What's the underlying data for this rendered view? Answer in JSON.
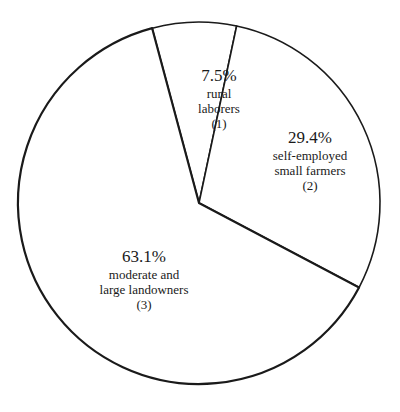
{
  "chart_data": {
    "type": "pie",
    "title": "",
    "slices": [
      {
        "label": "rural laborers",
        "number": "(1)",
        "value": 7.5,
        "pct_label": "7.5%",
        "lines": [
          "rural",
          "laborers",
          "(1)"
        ]
      },
      {
        "label": "self-employed small farmers",
        "number": "(2)",
        "value": 29.4,
        "pct_label": "29.4%",
        "lines": [
          "self-employed",
          "small farmers",
          "(2)"
        ]
      },
      {
        "label": "moderate and large landowners",
        "number": "(3)",
        "value": 63.1,
        "pct_label": "63.1%",
        "lines": [
          "moderate and",
          "large landowners",
          "(3)"
        ]
      }
    ],
    "start_angle_deg": -15,
    "direction": "clockwise",
    "fill": "#ffffff",
    "stroke": "#1a1a1a"
  }
}
